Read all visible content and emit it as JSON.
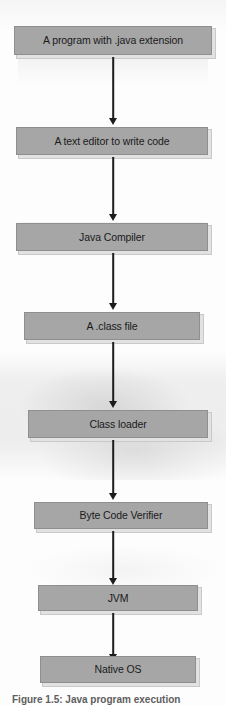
{
  "figure": {
    "type": "flowchart",
    "orientation": "top-to-bottom",
    "caption": "Figure 1.5: Java program execution",
    "box_color": "#a6a6a6",
    "box_border_color": "#8f8f8f",
    "arrow_color": "#1c1c1c",
    "text_color": "#1a1a1a",
    "background_color": "#ffffff"
  },
  "nodes": [
    {
      "id": "source",
      "label": "A program with .java extension"
    },
    {
      "id": "editor",
      "label": "A text editor to write code"
    },
    {
      "id": "compiler",
      "label": "Java Compiler"
    },
    {
      "id": "classfile",
      "label": "A .class file"
    },
    {
      "id": "classloader",
      "label": "Class loader"
    },
    {
      "id": "verifier",
      "label": "Byte Code Verifier"
    },
    {
      "id": "jvm",
      "label": "JVM"
    },
    {
      "id": "nativeos",
      "label": "Native OS"
    }
  ],
  "edges": [
    {
      "from": "source",
      "to": "editor"
    },
    {
      "from": "editor",
      "to": "compiler"
    },
    {
      "from": "compiler",
      "to": "classfile"
    },
    {
      "from": "classfile",
      "to": "classloader"
    },
    {
      "from": "classloader",
      "to": "verifier"
    },
    {
      "from": "verifier",
      "to": "jvm"
    },
    {
      "from": "jvm",
      "to": "nativeos"
    }
  ]
}
